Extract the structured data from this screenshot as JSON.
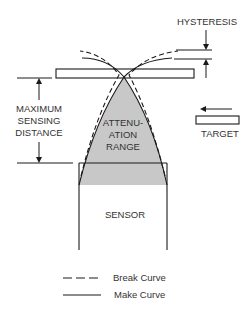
{
  "diagram": {
    "labels": {
      "hysteresis": "HYSTERESIS",
      "max_sensing_line1": "MAXIMUM",
      "max_sensing_line2": "SENSING",
      "max_sensing_line3": "DISTANCE",
      "attenuation_line1": "ATTENU-",
      "attenuation_line2": "ATION",
      "attenuation_line3": "RANGE",
      "target": "TARGET",
      "sensor": "SENSOR"
    },
    "legend": [
      {
        "style": "dashed",
        "label": "Break Curve"
      },
      {
        "style": "solid",
        "label": "Make Curve"
      }
    ],
    "colors": {
      "line": "#1a1a1a",
      "attenuation_fill": "#c8c8c8",
      "text": "#333333"
    }
  }
}
